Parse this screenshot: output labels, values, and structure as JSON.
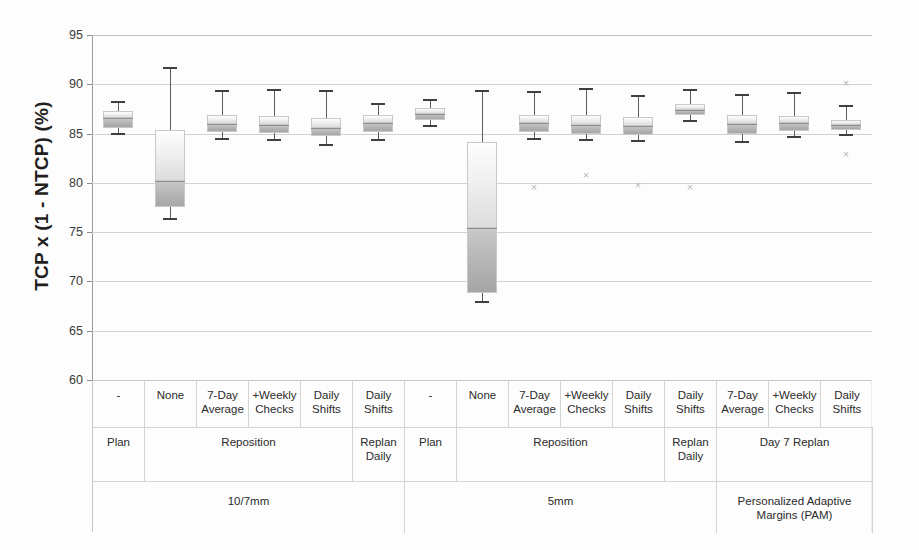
{
  "chart_data": {
    "type": "box",
    "title": "",
    "xlabel": "",
    "ylabel": "TCP x (1 - NTCP)  (%)",
    "ylim": [
      60,
      95
    ],
    "yticks": [
      60,
      65,
      70,
      75,
      80,
      85,
      90,
      95
    ],
    "grid": true,
    "legend": "none",
    "categories": [
      "-",
      "None",
      "7-Day Average",
      "+Weekly Checks",
      "Daily Shifts",
      "Daily Shifts",
      "-",
      "None",
      "7-Day Average",
      "+Weekly Checks",
      "Daily Shifts",
      "Daily Shifts",
      "7-Day Average",
      "+Weekly Checks",
      "Daily Shifts"
    ],
    "boxes": [
      {
        "label": "10/7mm | Plan | -",
        "whisker_low": 85.1,
        "q1": 85.6,
        "median": 86.6,
        "q3": 87.3,
        "whisker_high": 88.3,
        "outliers": []
      },
      {
        "label": "10/7mm | Reposition | None",
        "whisker_low": 76.4,
        "q1": 77.6,
        "median": 80.2,
        "q3": 85.4,
        "whisker_high": 91.8,
        "outliers": []
      },
      {
        "label": "10/7mm | Reposition | 7-Day Average",
        "whisker_low": 84.6,
        "q1": 85.2,
        "median": 86.0,
        "q3": 86.9,
        "whisker_high": 89.4,
        "outliers": []
      },
      {
        "label": "10/7mm | Reposition | +Weekly Checks",
        "whisker_low": 84.4,
        "q1": 85.1,
        "median": 85.9,
        "q3": 86.8,
        "whisker_high": 89.5,
        "outliers": []
      },
      {
        "label": "10/7mm | Reposition | Daily Shifts",
        "whisker_low": 83.9,
        "q1": 84.8,
        "median": 85.6,
        "q3": 86.6,
        "whisker_high": 89.4,
        "outliers": []
      },
      {
        "label": "10/7mm | Replan Daily | Daily Shifts",
        "whisker_low": 84.4,
        "q1": 85.2,
        "median": 86.1,
        "q3": 86.9,
        "whisker_high": 88.1,
        "outliers": []
      },
      {
        "label": "5mm | Plan | -",
        "whisker_low": 85.9,
        "q1": 86.4,
        "median": 87.0,
        "q3": 87.6,
        "whisker_high": 88.5,
        "outliers": []
      },
      {
        "label": "5mm | Reposition | None",
        "whisker_low": 68.0,
        "q1": 68.8,
        "median": 75.4,
        "q3": 84.1,
        "whisker_high": 89.4,
        "outliers": []
      },
      {
        "label": "5mm | Reposition | 7-Day Average",
        "whisker_low": 84.6,
        "q1": 85.2,
        "median": 86.1,
        "q3": 86.9,
        "whisker_high": 89.3,
        "outliers": [
          79.5
        ]
      },
      {
        "label": "5mm | Reposition | +Weekly Checks",
        "whisker_low": 84.4,
        "q1": 85.0,
        "median": 85.9,
        "q3": 86.9,
        "whisker_high": 89.6,
        "outliers": [
          80.7
        ]
      },
      {
        "label": "5mm | Reposition | Daily Shifts",
        "whisker_low": 84.3,
        "q1": 84.9,
        "median": 85.8,
        "q3": 86.7,
        "whisker_high": 88.9,
        "outliers": [
          79.7
        ]
      },
      {
        "label": "5mm | Replan Daily | Daily Shifts",
        "whisker_low": 86.4,
        "q1": 86.9,
        "median": 87.4,
        "q3": 88.0,
        "whisker_high": 89.5,
        "outliers": [
          79.5
        ]
      },
      {
        "label": "PAM | Day 7 Replan | 7-Day Average",
        "whisker_low": 84.2,
        "q1": 85.0,
        "median": 86.0,
        "q3": 86.9,
        "whisker_high": 89.0,
        "outliers": []
      },
      {
        "label": "PAM | Day 7 Replan | +Weekly Checks",
        "whisker_low": 84.8,
        "q1": 85.3,
        "median": 86.1,
        "q3": 86.8,
        "whisker_high": 89.2,
        "outliers": []
      },
      {
        "label": "PAM | Day 7 Replan | Daily Shifts",
        "whisker_low": 85.0,
        "q1": 85.4,
        "median": 85.9,
        "q3": 86.4,
        "whisker_high": 87.9,
        "outliers": [
          90.1,
          82.9
        ]
      }
    ]
  },
  "axis": {
    "ylabel": "TCP x (1 - NTCP)  (%)",
    "ticks": [
      "95",
      "90",
      "85",
      "80",
      "75",
      "70",
      "65",
      "60"
    ]
  },
  "table": {
    "row_detail": [
      {
        "text": "-"
      },
      {
        "text": "None"
      },
      {
        "text": "7-Day Average"
      },
      {
        "text": "+Weekly Checks"
      },
      {
        "text": "Daily Shifts"
      },
      {
        "text": "Daily Shifts"
      },
      {
        "text": "-"
      },
      {
        "text": "None"
      },
      {
        "text": "7-Day Average"
      },
      {
        "text": "+Weekly Checks"
      },
      {
        "text": "Daily Shifts"
      },
      {
        "text": "Daily Shifts"
      },
      {
        "text": "7-Day Average"
      },
      {
        "text": "+Weekly Checks"
      },
      {
        "text": "Daily Shifts"
      }
    ],
    "row_group": [
      {
        "text": "Plan",
        "span": 1
      },
      {
        "text": "Reposition",
        "span": 4
      },
      {
        "text": "Replan Daily",
        "span": 1
      },
      {
        "text": "Plan",
        "span": 1
      },
      {
        "text": "Reposition",
        "span": 4
      },
      {
        "text": "Replan Daily",
        "span": 1
      },
      {
        "text": "Day 7 Replan",
        "span": 3
      }
    ],
    "row_margin": [
      {
        "text": "10/7mm",
        "span": 6
      },
      {
        "text": "5mm",
        "span": 6
      },
      {
        "text": "Personalized Adaptive Margins (PAM)",
        "span": 3
      }
    ]
  }
}
